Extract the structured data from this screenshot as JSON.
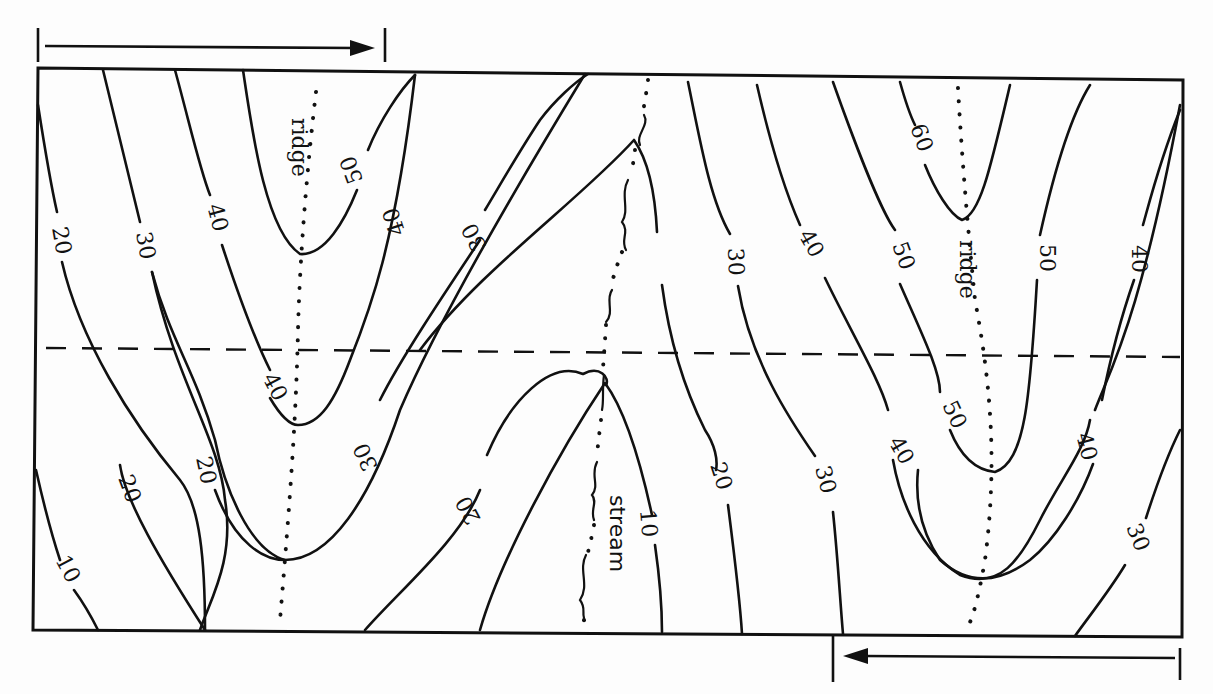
{
  "diagram": {
    "contour_interval": 10,
    "features": {
      "ridge_left": "ridge",
      "ridge_right": "ridge",
      "stream": "stream"
    },
    "contour_labels": [
      {
        "id": "l-20-a",
        "text": "20"
      },
      {
        "id": "l-30-a",
        "text": "30"
      },
      {
        "id": "l-40-a",
        "text": "40"
      },
      {
        "id": "l-50-a",
        "text": "50"
      },
      {
        "id": "l-40-b",
        "text": "40"
      },
      {
        "id": "l-30-b",
        "text": "30"
      },
      {
        "id": "l-40-c",
        "text": "40"
      },
      {
        "id": "l-30-c",
        "text": "30"
      },
      {
        "id": "l-20-b",
        "text": "20"
      },
      {
        "id": "l-10-a",
        "text": "10"
      },
      {
        "id": "l-20-c",
        "text": "20"
      },
      {
        "id": "l-20-d",
        "text": "20"
      },
      {
        "id": "l-30-d",
        "text": "30"
      },
      {
        "id": "l-40-d",
        "text": "40"
      },
      {
        "id": "l-10-b",
        "text": "10"
      },
      {
        "id": "l-20-e",
        "text": "20"
      },
      {
        "id": "l-30-e",
        "text": "30"
      },
      {
        "id": "l-60-a",
        "text": "60"
      },
      {
        "id": "l-50-b",
        "text": "50"
      },
      {
        "id": "l-50-c",
        "text": "50"
      },
      {
        "id": "l-40-e",
        "text": "40"
      },
      {
        "id": "l-40-f",
        "text": "40"
      },
      {
        "id": "l-50-d",
        "text": "50"
      },
      {
        "id": "l-40-g",
        "text": "40"
      },
      {
        "id": "l-30-f",
        "text": "30"
      }
    ],
    "direction_arrows": [
      {
        "id": "top-arrow",
        "direction": "right"
      },
      {
        "id": "bottom-arrow",
        "direction": "left"
      }
    ],
    "profile_line": "dashed cross-section line"
  }
}
